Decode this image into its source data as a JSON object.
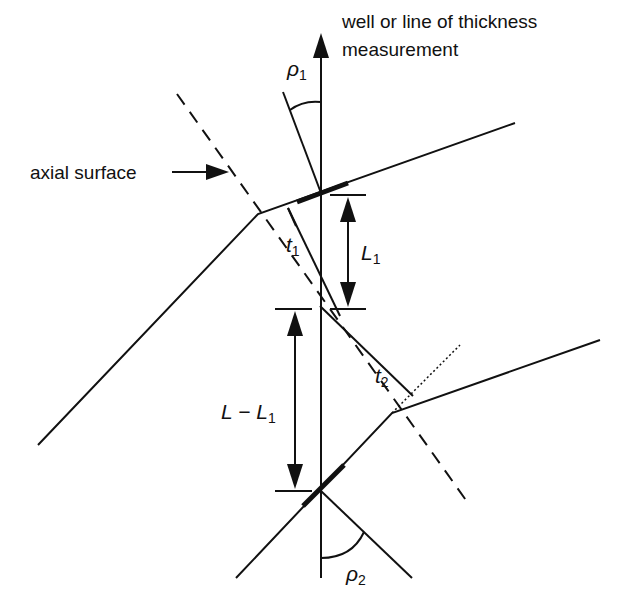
{
  "diagram": {
    "type": "fold thickness measurement geometry",
    "labels": {
      "well_line_1": "well or line of thickness",
      "well_line_2": "measurement",
      "axial_surface": "axial surface",
      "rho1": "ρ",
      "rho1_sub": "1",
      "rho2": "ρ",
      "rho2_sub": "2",
      "t1": "t",
      "t1_sub": "1",
      "t2": "t",
      "t2_sub": "2",
      "L1": "L",
      "L1_sub": "1",
      "LminusL1_main": "L − L",
      "LminusL1_sub": "1"
    },
    "colors": {
      "ink": "#111111",
      "background": "#ffffff"
    }
  }
}
